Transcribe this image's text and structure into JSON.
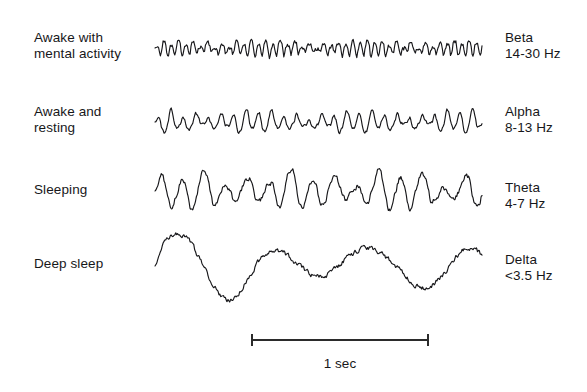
{
  "figure": {
    "background_color": "#ffffff",
    "trace_color": "#17171a",
    "text_color": "#17171a"
  },
  "rows": [
    {
      "state_label": "Awake with\nmental activity",
      "band_name": "Beta",
      "frequency_label": "14-30 Hz",
      "band_label": "Beta\n14-30 Hz",
      "waveform": {
        "name": "beta-waveform",
        "baseline_y": 48,
        "x_start": 155,
        "x_end": 482,
        "cycles": 45,
        "amplitude": 7,
        "jitter": 3.4,
        "roughness": 0.85,
        "stroke_width": 1.15,
        "seed": 17
      }
    },
    {
      "state_label": "Awake and\nresting",
      "band_name": "Alpha",
      "frequency_label": "8-13 Hz",
      "band_label": "Alpha\n8-13 Hz",
      "waveform": {
        "name": "alpha-waveform",
        "baseline_y": 122,
        "x_start": 155,
        "x_end": 482,
        "cycles": 26,
        "amplitude": 9,
        "jitter": 3.0,
        "roughness": 0.55,
        "stroke_width": 1.15,
        "seed": 43
      }
    },
    {
      "state_label": "Sleeping",
      "band_name": "Theta",
      "frequency_label": "4-7 Hz",
      "band_label": "Theta\n4-7 Hz",
      "waveform": {
        "name": "theta-waveform",
        "baseline_y": 191,
        "x_start": 155,
        "x_end": 482,
        "cycles": 15,
        "amplitude": 17,
        "jitter": 5.0,
        "roughness": 0.35,
        "stroke_width": 1.15,
        "seed": 91
      }
    },
    {
      "state_label": "Deep sleep",
      "band_name": "Delta",
      "frequency_label": "<3.5 Hz",
      "band_label": "Delta\n<3.5 Hz",
      "waveform": {
        "name": "delta-waveform",
        "baseline_y": 266,
        "x_start": 155,
        "x_end": 482,
        "cycles": 3.4,
        "amplitude": 26,
        "jitter": 4.5,
        "roughness": 0.12,
        "stroke_width": 1.15,
        "seed": 5
      }
    }
  ],
  "scale_bar": {
    "caption": "1 sec",
    "x_start": 252,
    "x_end": 428,
    "y": 340,
    "tick_height": 12,
    "color": "#2b2b2b"
  },
  "chart_data": {
    "type": "line",
    "xlabel": "1 sec",
    "ylabel": "",
    "grid": false,
    "legend_position": "right",
    "categories": [
      "Beta",
      "Alpha",
      "Theta",
      "Delta"
    ],
    "series": [
      {
        "name": "Beta",
        "state": "Awake with mental activity",
        "frequency_range_hz": [
          14,
          30
        ],
        "frequency_label": "14-30 Hz",
        "relative_amplitude": 7,
        "cycles_per_second": 45
      },
      {
        "name": "Alpha",
        "state": "Awake and resting",
        "frequency_range_hz": [
          8,
          13
        ],
        "frequency_label": "8-13 Hz",
        "relative_amplitude": 9,
        "cycles_per_second": 26
      },
      {
        "name": "Theta",
        "state": "Sleeping",
        "frequency_range_hz": [
          4,
          7
        ],
        "frequency_label": "4-7 Hz",
        "relative_amplitude": 17,
        "cycles_per_second": 15
      },
      {
        "name": "Delta",
        "state": "Deep sleep",
        "frequency_range_hz": [
          0,
          3.5
        ],
        "frequency_label": "<3.5 Hz",
        "relative_amplitude": 26,
        "cycles_per_second": 3.4
      }
    ]
  }
}
